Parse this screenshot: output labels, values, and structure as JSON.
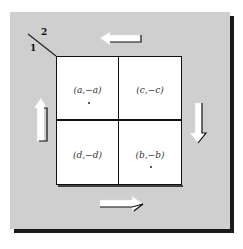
{
  "diagram": {
    "type": "payoff-matrix",
    "player_labels": {
      "row_player": "1",
      "column_player": "2"
    },
    "cells": [
      {
        "row": 0,
        "col": 0,
        "label": "(a,−a)",
        "starred": true
      },
      {
        "row": 0,
        "col": 1,
        "label": "(c,−c)",
        "starred": false
      },
      {
        "row": 1,
        "col": 0,
        "label": "(d,−d)",
        "starred": false
      },
      {
        "row": 1,
        "col": 1,
        "label": "(b,−b)",
        "starred": true
      }
    ],
    "arrows": [
      {
        "position": "top",
        "direction": "left"
      },
      {
        "position": "right",
        "direction": "down"
      },
      {
        "position": "bottom",
        "direction": "right"
      },
      {
        "position": "left",
        "direction": "up"
      }
    ],
    "colors": {
      "panel": "#cfcfcf",
      "shadow": "#1a1a1a",
      "cell": "#ffffff",
      "grid_line": "#111111"
    }
  }
}
